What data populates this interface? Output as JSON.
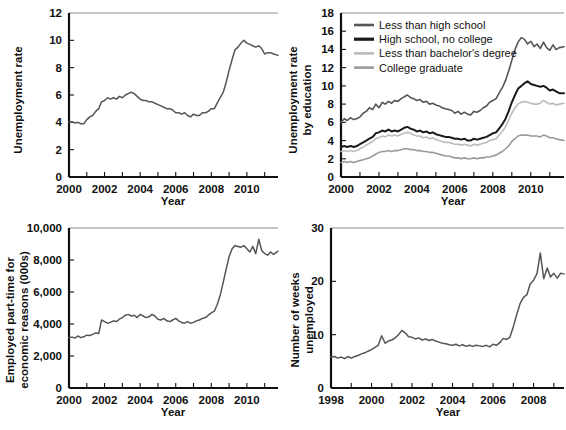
{
  "figure": {
    "background": "#ffffff",
    "panel_count": 4
  },
  "chart_data": [
    {
      "id": "unemployment-rate",
      "position": "top-left",
      "type": "line",
      "title": "",
      "xlabel": "Year",
      "ylabel": "Unemployment rate",
      "xlim": [
        2000,
        2011.75
      ],
      "ylim": [
        0,
        12
      ],
      "yticks": [
        0,
        2,
        4,
        6,
        8,
        10,
        12
      ],
      "ytick_labels": [
        "0",
        "2",
        "4",
        "6",
        "8",
        "10",
        "12"
      ],
      "xticks": [
        2000,
        2001,
        2002,
        2003,
        2004,
        2005,
        2006,
        2007,
        2008,
        2009,
        2010,
        2011
      ],
      "xtick_labels": [
        "2000",
        "",
        "2002",
        "",
        "2004",
        "",
        "2006",
        "",
        "2008",
        "",
        "2010",
        ""
      ],
      "grid": false,
      "legend": "none",
      "line_color": "#555555",
      "x": [
        2000.0,
        2000.17,
        2000.33,
        2000.5,
        2000.67,
        2000.83,
        2001.0,
        2001.17,
        2001.33,
        2001.5,
        2001.67,
        2001.83,
        2002.0,
        2002.17,
        2002.33,
        2002.5,
        2002.67,
        2002.83,
        2003.0,
        2003.17,
        2003.33,
        2003.5,
        2003.67,
        2003.83,
        2004.0,
        2004.17,
        2004.33,
        2004.5,
        2004.67,
        2004.83,
        2005.0,
        2005.17,
        2005.33,
        2005.5,
        2005.67,
        2005.83,
        2006.0,
        2006.17,
        2006.33,
        2006.5,
        2006.67,
        2006.83,
        2007.0,
        2007.17,
        2007.33,
        2007.5,
        2007.67,
        2007.83,
        2008.0,
        2008.17,
        2008.33,
        2008.5,
        2008.67,
        2008.83,
        2009.0,
        2009.17,
        2009.33,
        2009.5,
        2009.67,
        2009.83,
        2010.0,
        2010.17,
        2010.33,
        2010.5,
        2010.67,
        2010.83,
        2011.0,
        2011.17,
        2011.33,
        2011.5,
        2011.75
      ],
      "values": [
        4.0,
        4.05,
        3.95,
        4.0,
        3.9,
        3.9,
        4.2,
        4.4,
        4.5,
        4.8,
        5.0,
        5.5,
        5.6,
        5.8,
        5.7,
        5.8,
        5.7,
        5.9,
        5.8,
        6.0,
        6.1,
        6.2,
        6.1,
        5.9,
        5.7,
        5.6,
        5.6,
        5.5,
        5.5,
        5.4,
        5.3,
        5.2,
        5.1,
        5.0,
        5.0,
        4.9,
        4.7,
        4.7,
        4.6,
        4.7,
        4.5,
        4.4,
        4.6,
        4.5,
        4.5,
        4.7,
        4.7,
        4.8,
        5.0,
        5.0,
        5.4,
        5.8,
        6.2,
        6.9,
        7.8,
        8.6,
        9.3,
        9.5,
        9.8,
        10.0,
        9.8,
        9.7,
        9.6,
        9.5,
        9.6,
        9.4,
        9.0,
        9.1,
        9.1,
        9.0,
        8.9
      ]
    },
    {
      "id": "unemployment-rate-by-education",
      "position": "top-right",
      "type": "line",
      "title": "",
      "xlabel": "Year",
      "ylabel": "Unemployment rate\nby education",
      "ylabel_line1": "Unemployment rate",
      "ylabel_line2": "by education",
      "xlim": [
        2000,
        2011.75
      ],
      "ylim": [
        0,
        18
      ],
      "yticks": [
        0,
        2,
        4,
        6,
        8,
        10,
        12,
        14,
        16,
        18
      ],
      "ytick_labels": [
        "0",
        "2",
        "4",
        "6",
        "8",
        "10",
        "12",
        "14",
        "16",
        "18"
      ],
      "xticks": [
        2000,
        2001,
        2002,
        2003,
        2004,
        2005,
        2006,
        2007,
        2008,
        2009,
        2010,
        2011
      ],
      "xtick_labels": [
        "2000",
        "",
        "2002",
        "",
        "2004",
        "",
        "2006",
        "",
        "2008",
        "",
        "2010",
        ""
      ],
      "grid": false,
      "legend_position": "upper-left-inside",
      "x": [
        2000.0,
        2000.17,
        2000.33,
        2000.5,
        2000.67,
        2000.83,
        2001.0,
        2001.17,
        2001.33,
        2001.5,
        2001.67,
        2001.83,
        2002.0,
        2002.17,
        2002.33,
        2002.5,
        2002.67,
        2002.83,
        2003.0,
        2003.17,
        2003.33,
        2003.5,
        2003.67,
        2003.83,
        2004.0,
        2004.17,
        2004.33,
        2004.5,
        2004.67,
        2004.83,
        2005.0,
        2005.17,
        2005.33,
        2005.5,
        2005.67,
        2005.83,
        2006.0,
        2006.17,
        2006.33,
        2006.5,
        2006.67,
        2006.83,
        2007.0,
        2007.17,
        2007.33,
        2007.5,
        2007.67,
        2007.83,
        2008.0,
        2008.17,
        2008.33,
        2008.5,
        2008.67,
        2008.83,
        2009.0,
        2009.17,
        2009.33,
        2009.5,
        2009.67,
        2009.83,
        2010.0,
        2010.17,
        2010.33,
        2010.5,
        2010.67,
        2010.83,
        2011.0,
        2011.17,
        2011.33,
        2011.5,
        2011.75
      ],
      "series": [
        {
          "name": "Less than high school",
          "color": "#555555",
          "values": [
            6.0,
            6.4,
            6.2,
            6.5,
            6.3,
            6.4,
            6.6,
            7.0,
            7.2,
            7.6,
            7.4,
            8.0,
            7.6,
            8.2,
            8.0,
            8.3,
            8.1,
            8.4,
            8.3,
            8.6,
            8.8,
            9.0,
            8.7,
            8.6,
            8.4,
            8.5,
            8.2,
            8.3,
            8.0,
            8.1,
            7.9,
            7.8,
            7.6,
            7.5,
            7.4,
            7.3,
            7.0,
            7.2,
            6.9,
            7.1,
            6.9,
            6.8,
            7.2,
            7.1,
            7.3,
            7.6,
            7.8,
            8.2,
            8.4,
            8.6,
            9.2,
            9.8,
            10.6,
            11.6,
            12.8,
            14.0,
            14.8,
            15.3,
            15.1,
            14.6,
            14.9,
            14.3,
            14.6,
            14.1,
            14.8,
            14.2,
            13.9,
            14.5,
            14.0,
            14.2,
            14.3
          ]
        },
        {
          "name": "High school, no college",
          "color": "#1a1a1a",
          "values": [
            3.3,
            3.4,
            3.3,
            3.4,
            3.3,
            3.4,
            3.6,
            3.8,
            4.0,
            4.2,
            4.4,
            4.8,
            4.9,
            5.1,
            5.0,
            5.2,
            5.0,
            5.1,
            5.0,
            5.2,
            5.4,
            5.5,
            5.3,
            5.2,
            5.0,
            5.1,
            4.9,
            5.0,
            4.8,
            4.9,
            4.7,
            4.6,
            4.5,
            4.4,
            4.4,
            4.3,
            4.2,
            4.2,
            4.1,
            4.2,
            4.0,
            4.0,
            4.2,
            4.1,
            4.2,
            4.3,
            4.4,
            4.6,
            4.8,
            4.9,
            5.3,
            5.8,
            6.4,
            7.2,
            8.2,
            9.0,
            9.7,
            10.0,
            10.3,
            10.5,
            10.2,
            10.1,
            10.0,
            9.9,
            10.0,
            9.8,
            9.5,
            9.6,
            9.4,
            9.2,
            9.2
          ]
        },
        {
          "name": "Less than bachelor's degree",
          "color": "#bcbcbc",
          "values": [
            2.8,
            2.9,
            2.8,
            2.9,
            2.8,
            2.9,
            3.1,
            3.3,
            3.5,
            3.7,
            3.9,
            4.2,
            4.3,
            4.5,
            4.4,
            4.6,
            4.5,
            4.6,
            4.5,
            4.7,
            4.8,
            4.9,
            4.8,
            4.6,
            4.5,
            4.5,
            4.3,
            4.4,
            4.2,
            4.3,
            4.1,
            4.0,
            3.9,
            3.8,
            3.8,
            3.7,
            3.6,
            3.6,
            3.5,
            3.6,
            3.5,
            3.4,
            3.6,
            3.5,
            3.6,
            3.7,
            3.8,
            4.0,
            4.1,
            4.2,
            4.6,
            5.0,
            5.5,
            6.2,
            7.0,
            7.6,
            8.0,
            8.2,
            8.3,
            8.2,
            8.1,
            8.0,
            8.0,
            8.1,
            8.4,
            8.2,
            8.0,
            8.1,
            7.9,
            8.0,
            8.1
          ]
        },
        {
          "name": "College graduate",
          "color": "#9a9a9a",
          "values": [
            1.6,
            1.7,
            1.6,
            1.7,
            1.6,
            1.7,
            1.8,
            1.9,
            2.0,
            2.1,
            2.3,
            2.5,
            2.7,
            2.8,
            2.8,
            2.9,
            2.8,
            2.9,
            2.9,
            3.0,
            3.1,
            3.1,
            3.0,
            3.0,
            2.9,
            2.9,
            2.8,
            2.8,
            2.7,
            2.7,
            2.6,
            2.5,
            2.4,
            2.3,
            2.3,
            2.2,
            2.1,
            2.1,
            2.0,
            2.1,
            2.0,
            2.0,
            2.1,
            2.0,
            2.1,
            2.1,
            2.2,
            2.2,
            2.3,
            2.4,
            2.6,
            2.8,
            3.1,
            3.4,
            3.9,
            4.2,
            4.5,
            4.6,
            4.6,
            4.6,
            4.5,
            4.5,
            4.5,
            4.4,
            4.6,
            4.5,
            4.3,
            4.3,
            4.2,
            4.1,
            4.0
          ]
        }
      ]
    },
    {
      "id": "employed-part-time-economic-reasons",
      "position": "bottom-left",
      "type": "line",
      "title": "",
      "xlabel": "Year",
      "ylabel": "Employed part-time for\neconomic reasons (000s)",
      "ylabel_line1": "Employed part-time for",
      "ylabel_line2": "economic reasons (000s)",
      "xlim": [
        2000,
        2011.75
      ],
      "ylim": [
        0,
        10000
      ],
      "yticks": [
        0,
        2000,
        4000,
        6000,
        8000,
        10000
      ],
      "ytick_labels": [
        "0",
        "2,000",
        "4,000",
        "6,000",
        "8,000",
        "10,000"
      ],
      "xticks": [
        2000,
        2001,
        2002,
        2003,
        2004,
        2005,
        2006,
        2007,
        2008,
        2009,
        2010,
        2011
      ],
      "xtick_labels": [
        "2000",
        "",
        "2002",
        "",
        "2004",
        "",
        "2006",
        "",
        "2008",
        "",
        "2010",
        ""
      ],
      "grid": false,
      "legend": "none",
      "line_color": "#555555",
      "x": [
        2000.0,
        2000.17,
        2000.33,
        2000.5,
        2000.67,
        2000.83,
        2001.0,
        2001.17,
        2001.33,
        2001.5,
        2001.67,
        2001.83,
        2002.0,
        2002.17,
        2002.33,
        2002.5,
        2002.67,
        2002.83,
        2003.0,
        2003.17,
        2003.33,
        2003.5,
        2003.67,
        2003.83,
        2004.0,
        2004.17,
        2004.33,
        2004.5,
        2004.67,
        2004.83,
        2005.0,
        2005.17,
        2005.33,
        2005.5,
        2005.67,
        2005.83,
        2006.0,
        2006.17,
        2006.33,
        2006.5,
        2006.67,
        2006.83,
        2007.0,
        2007.17,
        2007.33,
        2007.5,
        2007.67,
        2007.83,
        2008.0,
        2008.17,
        2008.33,
        2008.5,
        2008.67,
        2008.83,
        2009.0,
        2009.17,
        2009.33,
        2009.5,
        2009.67,
        2009.83,
        2010.0,
        2010.17,
        2010.33,
        2010.5,
        2010.67,
        2010.83,
        2011.0,
        2011.17,
        2011.33,
        2011.5,
        2011.75
      ],
      "values": [
        3150,
        3180,
        3120,
        3250,
        3150,
        3200,
        3300,
        3280,
        3350,
        3450,
        3400,
        4250,
        4150,
        4050,
        4100,
        4200,
        4150,
        4300,
        4400,
        4550,
        4600,
        4500,
        4550,
        4400,
        4600,
        4500,
        4400,
        4450,
        4600,
        4500,
        4300,
        4250,
        4350,
        4200,
        4150,
        4250,
        4350,
        4200,
        4100,
        4050,
        4150,
        4050,
        4100,
        4200,
        4250,
        4350,
        4400,
        4550,
        4700,
        4800,
        5200,
        5800,
        6600,
        7400,
        8200,
        8700,
        8900,
        8850,
        8800,
        8900,
        8700,
        8500,
        8850,
        8400,
        9300,
        8600,
        8400,
        8300,
        8500,
        8350,
        8550
      ]
    },
    {
      "id": "number-of-weeks-unemployed",
      "position": "bottom-right",
      "type": "line",
      "title": "",
      "xlabel": "Year",
      "ylabel": "Number of weeks\nunemployed",
      "ylabel_line1": "Number of weeks",
      "ylabel_line2": "unemployed",
      "xlim": [
        1998,
        2009.5
      ],
      "ylim": [
        0,
        30
      ],
      "yticks": [
        0,
        10,
        20,
        30
      ],
      "ytick_labels": [
        "0",
        "10",
        "20",
        "30"
      ],
      "xticks": [
        1998,
        1999,
        2000,
        2001,
        2002,
        2003,
        2004,
        2005,
        2006,
        2007,
        2008,
        2009
      ],
      "xtick_labels": [
        "1998",
        "",
        "2000",
        "",
        "2002",
        "",
        "2004",
        "",
        "2006",
        "",
        "2008",
        ""
      ],
      "grid": false,
      "legend": "none",
      "line_color": "#555555",
      "x": [
        1998.0,
        1998.17,
        1998.33,
        1998.5,
        1998.67,
        1998.83,
        1999.0,
        1999.17,
        1999.33,
        1999.5,
        1999.67,
        1999.83,
        2000.0,
        2000.17,
        2000.33,
        2000.5,
        2000.67,
        2000.83,
        2001.0,
        2001.17,
        2001.33,
        2001.5,
        2001.67,
        2001.83,
        2002.0,
        2002.17,
        2002.33,
        2002.5,
        2002.67,
        2002.83,
        2003.0,
        2003.17,
        2003.33,
        2003.5,
        2003.67,
        2003.83,
        2004.0,
        2004.17,
        2004.33,
        2004.5,
        2004.67,
        2004.83,
        2005.0,
        2005.17,
        2005.33,
        2005.5,
        2005.67,
        2005.83,
        2006.0,
        2006.17,
        2006.33,
        2006.5,
        2006.67,
        2006.83,
        2007.0,
        2007.17,
        2007.33,
        2007.5,
        2007.67,
        2007.83,
        2008.0,
        2008.17,
        2008.33,
        2008.5,
        2008.67,
        2008.83,
        2009.0,
        2009.17,
        2009.33,
        2009.5
      ],
      "values": [
        5.8,
        5.9,
        5.6,
        5.8,
        5.5,
        5.9,
        5.6,
        5.9,
        6.1,
        6.4,
        6.6,
        6.9,
        7.2,
        7.6,
        8.0,
        9.8,
        8.4,
        8.8,
        9.0,
        9.4,
        10.0,
        10.8,
        10.3,
        9.6,
        9.5,
        9.2,
        9.4,
        9.0,
        9.2,
        8.9,
        9.1,
        8.8,
        8.6,
        8.4,
        8.3,
        8.1,
        8.0,
        8.2,
        7.9,
        8.1,
        7.8,
        8.0,
        7.8,
        8.0,
        7.9,
        7.8,
        8.0,
        7.7,
        8.2,
        8.0,
        8.5,
        9.3,
        9.1,
        9.5,
        11.5,
        13.8,
        15.8,
        17.0,
        17.5,
        19.5,
        20.2,
        21.5,
        25.3,
        20.5,
        22.5,
        20.8,
        21.5,
        20.6,
        21.5,
        21.4
      ]
    }
  ]
}
